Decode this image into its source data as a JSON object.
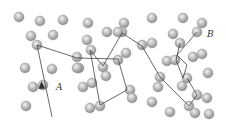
{
  "diagram": {
    "title": "",
    "colors": {
      "background": "#ffffff",
      "atom_fill": "#b5b5b5",
      "atom_edge": "#8a8a8a",
      "atom_highlight": "#eeeeee",
      "path": "#444444"
    },
    "atom_radius": 5,
    "atoms": [
      [
        19,
        17
      ],
      [
        40,
        21
      ],
      [
        63,
        20
      ],
      [
        88,
        23
      ],
      [
        124,
        23
      ],
      [
        152,
        18
      ],
      [
        183,
        18
      ],
      [
        202,
        23
      ],
      [
        31,
        36
      ],
      [
        53,
        35
      ],
      [
        87,
        40
      ],
      [
        107,
        32
      ],
      [
        122,
        32
      ],
      [
        152,
        43
      ],
      [
        173,
        34
      ],
      [
        197,
        32
      ],
      [
        37,
        45
      ],
      [
        77,
        57
      ],
      [
        91,
        50
      ],
      [
        126,
        53
      ],
      [
        142,
        45
      ],
      [
        180,
        43
      ],
      [
        202,
        54
      ],
      [
        193,
        57
      ],
      [
        25,
        68
      ],
      [
        52,
        69
      ],
      [
        79,
        68
      ],
      [
        103,
        67
      ],
      [
        118,
        60
      ],
      [
        167,
        61
      ],
      [
        175,
        60
      ],
      [
        208,
        73
      ],
      [
        33,
        87
      ],
      [
        43,
        85
      ],
      [
        83,
        87
      ],
      [
        92,
        83
      ],
      [
        106,
        76
      ],
      [
        158,
        87
      ],
      [
        160,
        77
      ],
      [
        182,
        86
      ],
      [
        187,
        78
      ],
      [
        26,
        106
      ],
      [
        90,
        108
      ],
      [
        100,
        106
      ],
      [
        130,
        90
      ],
      [
        132,
        98
      ],
      [
        152,
        102
      ],
      [
        197,
        95
      ],
      [
        207,
        98
      ],
      [
        170,
        112
      ],
      [
        189,
        106
      ],
      [
        195,
        113
      ],
      [
        209,
        114
      ],
      [
        77,
        68
      ],
      [
        118,
        32
      ]
    ],
    "paths": [
      {
        "name": "A",
        "points": [
          [
            52,
            117
          ],
          [
            37,
            45
          ],
          [
            77,
            58
          ],
          [
            118,
            59
          ],
          [
            127,
            90
          ],
          [
            100,
            105
          ],
          [
            90,
            50
          ],
          [
            103,
            66
          ],
          [
            122,
            33
          ],
          [
            142,
            46
          ],
          [
            160,
            77
          ],
          [
            189,
            106
          ],
          [
            197,
            95
          ],
          [
            187,
            78
          ]
        ]
      },
      {
        "name": "B",
        "points": [
          [
            197,
            32
          ],
          [
            177,
            55
          ],
          [
            187,
            65
          ],
          [
            183,
            78
          ],
          [
            176,
            60
          ],
          [
            180,
            43
          ]
        ]
      }
    ],
    "arrow": {
      "at": [
        43,
        88
      ],
      "direction": "up"
    },
    "labels": [
      {
        "text": "A",
        "x": 56,
        "y": 90
      },
      {
        "text": "B",
        "x": 207,
        "y": 37
      }
    ]
  }
}
